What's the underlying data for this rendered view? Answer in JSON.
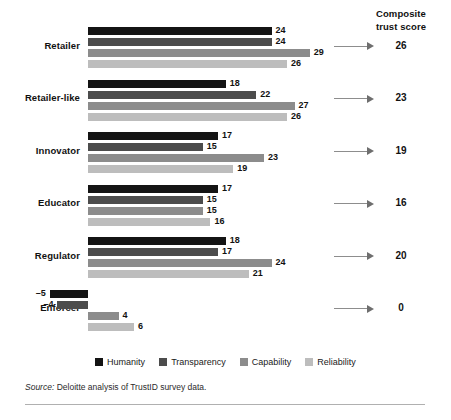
{
  "header": {
    "line1": "Composite",
    "line2": "trust score"
  },
  "chart_data": {
    "type": "bar",
    "orientation": "horizontal",
    "title": "",
    "xlabel": "",
    "ylabel": "",
    "grid": false,
    "legend_position": "bottom-center",
    "xlim": [
      -6,
      30
    ],
    "baseline": 0,
    "categories": [
      "Retailer",
      "Retailer-like",
      "Innovator",
      "Educator",
      "Regulator",
      "Enforcer"
    ],
    "series": [
      {
        "name": "Humanity",
        "color": "#141414",
        "values": [
          24,
          18,
          17,
          17,
          18,
          -5
        ]
      },
      {
        "name": "Transparency",
        "color": "#4c4c4c",
        "values": [
          24,
          22,
          15,
          15,
          17,
          -4
        ]
      },
      {
        "name": "Capability",
        "color": "#8c8c8c",
        "values": [
          29,
          27,
          23,
          15,
          24,
          4
        ]
      },
      {
        "name": "Reliability",
        "color": "#bdbdbd",
        "values": [
          26,
          26,
          19,
          16,
          21,
          6
        ]
      }
    ],
    "composite_trust_score": {
      "label": "Composite trust score",
      "values": [
        26,
        23,
        19,
        16,
        20,
        0
      ]
    }
  },
  "legend": {
    "items": [
      {
        "label": "Humanity",
        "color": "#141414"
      },
      {
        "label": "Transparency",
        "color": "#4c4c4c"
      },
      {
        "label": "Capability",
        "color": "#8c8c8c"
      },
      {
        "label": "Reliability",
        "color": "#bdbdbd"
      }
    ]
  },
  "source": {
    "prefix": "Source:",
    "text": "Deloitte analysis of TrustID survey data."
  }
}
